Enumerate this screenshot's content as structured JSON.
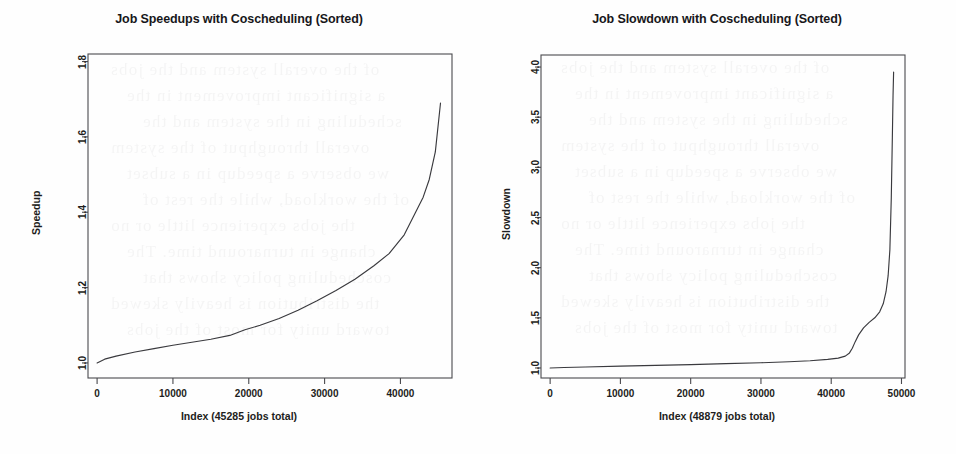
{
  "figure": {
    "background_color": "#fefefe",
    "ink_color": "#3a3a3e",
    "axis_color": "#4a4a4e",
    "ghost_text": [
      "of the overall system and the jobs",
      "a significant improvement in the",
      "scheduling in the system and the",
      "overall throughput of the system",
      "we observe a speedup in a subset",
      "of the workload, while the rest of",
      "the jobs experience little or no",
      "change in turnaround time. The",
      "coscheduling policy shows that",
      "the distribution is heavily skewed",
      "toward unity for most of the jobs"
    ]
  },
  "charts": [
    {
      "panel": "left",
      "title": "Job Speedups with Coscheduling (Sorted)",
      "xlabel": "Index (45285 jobs total)",
      "ylabel": "Speedup"
    },
    {
      "panel": "right",
      "title": "Job Slowdown with Coscheduling (Sorted)",
      "xlabel": "Index (48879 jobs total)",
      "ylabel": "Slowdown"
    }
  ],
  "chart_data": [
    {
      "type": "line",
      "title": "Job Speedups with Coscheduling (Sorted)",
      "xlabel": "Index (45285 jobs total)",
      "ylabel": "Speedup",
      "xlim": [
        -1200,
        46800
      ],
      "ylim": [
        0.96,
        1.82
      ],
      "xticks": [
        0,
        10000,
        20000,
        30000,
        40000
      ],
      "xticklabels": [
        "0",
        "10000",
        "20000",
        "30000",
        "40000"
      ],
      "yticks": [
        1.0,
        1.2,
        1.4,
        1.6,
        1.8
      ],
      "yticklabels": [
        "1.0",
        "1.2",
        "1.4",
        "1.6",
        "1.8"
      ],
      "grid": false,
      "legend": false,
      "total_jobs": 45285,
      "series": [
        {
          "name": "Speedup (sorted ascending)",
          "x": [
            0,
            1000,
            2500,
            5000,
            7500,
            10000,
            12500,
            15000,
            17500,
            19500,
            21500,
            24000,
            26500,
            29000,
            31500,
            34000,
            36500,
            38500,
            40500,
            42000,
            42300,
            43000,
            43800,
            44600,
            45285
          ],
          "y": [
            1.0,
            1.01,
            1.018,
            1.029,
            1.038,
            1.047,
            1.055,
            1.063,
            1.073,
            1.088,
            1.1,
            1.118,
            1.14,
            1.165,
            1.192,
            1.222,
            1.258,
            1.29,
            1.34,
            1.4,
            1.412,
            1.44,
            1.487,
            1.56,
            1.69
          ]
        }
      ]
    },
    {
      "type": "line",
      "title": "Job Slowdown with Coscheduling (Sorted)",
      "xlabel": "Index (48879 jobs total)",
      "ylabel": "Slowdown",
      "xlim": [
        -1300,
        50500
      ],
      "ylim": [
        0.9,
        4.12
      ],
      "xticks": [
        0,
        10000,
        20000,
        30000,
        40000,
        50000
      ],
      "xticklabels": [
        "0",
        "10000",
        "20000",
        "30000",
        "40000",
        "50000"
      ],
      "yticks": [
        1.0,
        1.5,
        2.0,
        2.5,
        3.0,
        3.5,
        4.0
      ],
      "yticklabels": [
        "1.0",
        "1.5",
        "2.0",
        "2.5",
        "3.0",
        "3.5",
        "4.0"
      ],
      "grid": false,
      "legend": false,
      "total_jobs": 48879,
      "series": [
        {
          "name": "Slowdown (sorted ascending)",
          "x": [
            0,
            2000,
            5000,
            10000,
            15000,
            20000,
            25000,
            30000,
            34000,
            37000,
            39500,
            41000,
            42000,
            42600,
            43000,
            43400,
            43900,
            44600,
            45400,
            46200,
            46900,
            47400,
            47800,
            48100,
            48350,
            48550,
            48700,
            48800,
            48879
          ],
          "y": [
            1.0,
            1.005,
            1.01,
            1.018,
            1.026,
            1.034,
            1.043,
            1.052,
            1.062,
            1.072,
            1.085,
            1.098,
            1.118,
            1.15,
            1.196,
            1.26,
            1.33,
            1.4,
            1.455,
            1.5,
            1.56,
            1.64,
            1.76,
            1.92,
            2.18,
            2.7,
            3.3,
            3.72,
            3.95
          ]
        }
      ]
    }
  ]
}
